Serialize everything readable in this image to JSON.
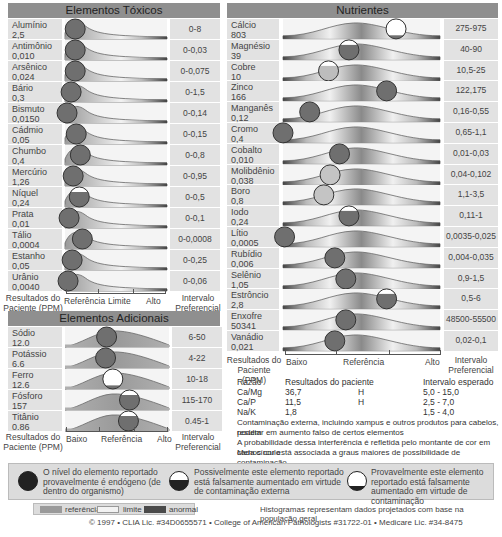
{
  "toxic": {
    "title": "Elementos Tóxicos",
    "rows": [
      {
        "name": "Alumínio",
        "value": "2,5",
        "range": "0-8",
        "pos": 0.1,
        "type": "endogenous"
      },
      {
        "name": "Antimônio",
        "value": "0,010",
        "range": "0-0,03",
        "pos": 0.1,
        "type": "endogenous"
      },
      {
        "name": "Arsênico",
        "value": "0,024",
        "range": "0-0,075",
        "pos": 0.1,
        "type": "endogenous"
      },
      {
        "name": "Bário",
        "value": "0,3",
        "range": "0-1,5",
        "pos": 0.06,
        "type": "endogenous"
      },
      {
        "name": "Bismuto",
        "value": "0,0150",
        "range": "0-0,14",
        "pos": 0.02,
        "type": "endogenous"
      },
      {
        "name": "Cádmio",
        "value": "0,05",
        "range": "0-0,15",
        "pos": 0.11,
        "type": "endogenous"
      },
      {
        "name": "Chumbo",
        "value": "0,4",
        "range": "0-0,8",
        "pos": 0.15,
        "type": "endogenous"
      },
      {
        "name": "Mercúrio",
        "value": "1,26",
        "range": "0-0,95",
        "pos": 0.08,
        "type": "endogenous"
      },
      {
        "name": "Níquel",
        "value": "0,24",
        "range": "0-0,5",
        "pos": 0.14,
        "type": "possible"
      },
      {
        "name": "Prata",
        "value": "0,01",
        "range": "0-0,1",
        "pos": 0.04,
        "type": "endogenous"
      },
      {
        "name": "Tálio",
        "value": "0,0004",
        "range": "0-0,0008",
        "pos": 0.17,
        "type": "endogenous"
      },
      {
        "name": "Estanho",
        "value": "0,05",
        "range": "0-0,25",
        "pos": 0.07,
        "type": "endogenous"
      },
      {
        "name": "Urânio",
        "value": "0,0040",
        "range": "0-0,06",
        "pos": 0.03,
        "type": "endogenous"
      }
    ],
    "footer": {
      "left": "Resultados do Paciente (PPM)",
      "axis": [
        "Referência",
        "Limite",
        "Alto"
      ],
      "right": "Intervalo Preferencial"
    }
  },
  "additional": {
    "title": "Elementos Adicionais",
    "rows": [
      {
        "name": "Sódio",
        "value": "12.0",
        "range": "6-50",
        "pos": 0.4,
        "type": "endogenous"
      },
      {
        "name": "Potássio",
        "value": "6.6",
        "range": "4-22",
        "pos": 0.39,
        "type": "endogenous"
      },
      {
        "name": "Ferro",
        "value": "12.6",
        "range": "10-18",
        "pos": 0.46,
        "type": "probable"
      },
      {
        "name": "Fósforo",
        "value": "157",
        "range": "115-170",
        "pos": 0.62,
        "type": "possible"
      },
      {
        "name": "Titânio",
        "value": "0.86",
        "range": "0.45-1",
        "pos": 0.61,
        "type": "possible"
      }
    ],
    "footer": {
      "left": "Resultados do Paciente (PPM)",
      "axis": [
        "Baixo",
        "Referência",
        "Alto"
      ],
      "right": "Intervalo Preferencial"
    }
  },
  "nutrients": {
    "title": "Nutrientes",
    "rows": [
      {
        "name": "Cálcio",
        "value": "803",
        "range": "275-975",
        "pos": 0.72,
        "type": "probable"
      },
      {
        "name": "Magnésio",
        "value": "39",
        "range": "40-90",
        "pos": 0.42,
        "type": "possible"
      },
      {
        "name": "Cobre",
        "value": "10",
        "range": "10,5-25",
        "pos": 0.29,
        "type": "light-possible"
      },
      {
        "name": "Zinco",
        "value": "166",
        "range": "122,175",
        "pos": 0.66,
        "type": "endogenous"
      },
      {
        "name": "Manganês",
        "value": "0,12",
        "range": "0,16-0,55",
        "pos": 0.17,
        "type": "endogenous"
      },
      {
        "name": "Cromo",
        "value": "0,4",
        "range": "0,65-1,1",
        "pos": 0.0,
        "type": "endogenous"
      },
      {
        "name": "Cobalto",
        "value": "0,010",
        "range": "0,01-0,03",
        "pos": 0.36,
        "type": "endogenous"
      },
      {
        "name": "Molibdênio",
        "value": "0,038",
        "range": "0,04-0,102",
        "pos": 0.3,
        "type": "light"
      },
      {
        "name": "Boro",
        "value": "0,8",
        "range": "1,1-3,5",
        "pos": 0.26,
        "type": "light"
      },
      {
        "name": "Iodo",
        "value": "0,24",
        "range": "0,11-1",
        "pos": 0.42,
        "type": "possible"
      },
      {
        "name": "Lítio",
        "value": "0,0005",
        "range": "0,0035-0,025",
        "pos": 0.01,
        "type": "endogenous"
      },
      {
        "name": "Rubídio",
        "value": "0,006",
        "range": "0,004-0,035",
        "pos": 0.33,
        "type": "endogenous"
      },
      {
        "name": "Selênio",
        "value": "1,05",
        "range": "0,9-1,5",
        "pos": 0.4,
        "type": "endogenous"
      },
      {
        "name": "Estrôncio",
        "value": "2,8",
        "range": "0,5-6",
        "pos": 0.66,
        "type": "possible"
      },
      {
        "name": "Enxofre",
        "value": "50341",
        "range": "48500-55500",
        "pos": 0.4,
        "type": "endogenous"
      },
      {
        "name": "Vanádio",
        "value": "0,021",
        "range": "0,02-0,1",
        "pos": 0.33,
        "type": "endogenous"
      }
    ],
    "footer": {
      "left": "Resultados do Paciente (PPM)",
      "axis": [
        "Baixo",
        "Referência",
        "Alto"
      ],
      "right": "Intervalo Preferencial"
    }
  },
  "ratios": {
    "headers": [
      "Razão",
      "Resultados do paciente",
      "Intervalo esperado"
    ],
    "rows": [
      {
        "ratio": "Ca/Mg",
        "result": "36,7",
        "flag": "H",
        "expected": "5,0 - 15,0"
      },
      {
        "ratio": "Ca/P",
        "result": "11,5",
        "flag": "H",
        "expected": "2,5 - 7,0"
      },
      {
        "ratio": "Na/K",
        "result": "1,8",
        "flag": "",
        "expected": "1,5 - 4,0"
      }
    ],
    "notes": [
      "Contaminação externa, incluindo xampus e outros produtos para cabelos, podem",
      "resultar em aumento falso de certos elementos",
      "A probabilidade dessa interferência é refletida pelo montante de cor em cada círculo",
      "Menos cor está associada a graus maiores de possibilidade de contaminação"
    ]
  },
  "legend": {
    "items": [
      {
        "icon": "solid-circle-icon",
        "text": "O nível do elemento reportado provavelmente é endógeno (de dentro do organismo)"
      },
      {
        "icon": "half-circle-icon",
        "text": "Possivelmente este elemento reportado está falsamente aumentado em virtude de contaminação externa"
      },
      {
        "icon": "empty-circle-icon",
        "text": "Provavelmente este elemento reportado está falsamente aumentado em virtude de contaminação"
      }
    ],
    "swatches": [
      {
        "label": "referência",
        "color": "#9a9a9a"
      },
      {
        "label": "limite",
        "color": "#f2f2f2"
      },
      {
        "label": "anormal",
        "color": "#4a4a4a"
      }
    ],
    "histogram_note": "Histogramas representam dados projetados com base na população geral",
    "copyright": "© 1997 • CLIA Lic. #34D0655571 • College of American Pathologists #31722-01 • Medicare Lic. #34-8475"
  },
  "chart_data": [
    {
      "type": "scatter",
      "title": "Elementos Tóxicos",
      "xlabel": "Referência | Limite | Alto",
      "ylabel": "Resultados do Paciente (PPM)",
      "categories": [
        "Alumínio",
        "Antimônio",
        "Arsênico",
        "Bário",
        "Bismuto",
        "Cádmio",
        "Chumbo",
        "Mercúrio",
        "Níquel",
        "Prata",
        "Tálio",
        "Estanho",
        "Urânio"
      ],
      "values": [
        2.5,
        0.01,
        0.024,
        0.3,
        0.015,
        0.05,
        0.4,
        1.26,
        0.24,
        0.01,
        0.0004,
        0.05,
        0.004
      ],
      "reference_ranges": [
        "0-8",
        "0-0,03",
        "0-0,075",
        "0-1,5",
        "0-0,14",
        "0-0,15",
        "0-0,8",
        "0-0,95",
        "0-0,5",
        "0-0,1",
        "0-0,0008",
        "0-0,25",
        "0-0,06"
      ]
    },
    {
      "type": "scatter",
      "title": "Elementos Adicionais",
      "xlabel": "Baixo | Referência | Alto",
      "categories": [
        "Sódio",
        "Potássio",
        "Ferro",
        "Fósforo",
        "Titânio"
      ],
      "values": [
        12.0,
        6.6,
        12.6,
        157,
        0.86
      ],
      "reference_ranges": [
        "6-50",
        "4-22",
        "10-18",
        "115-170",
        "0.45-1"
      ]
    },
    {
      "type": "scatter",
      "title": "Nutrientes",
      "xlabel": "Baixo | Referência | Alto",
      "categories": [
        "Cálcio",
        "Magnésio",
        "Cobre",
        "Zinco",
        "Manganês",
        "Cromo",
        "Cobalto",
        "Molibdênio",
        "Boro",
        "Iodo",
        "Lítio",
        "Rubídio",
        "Selênio",
        "Estrôncio",
        "Enxofre",
        "Vanádio"
      ],
      "values": [
        803,
        39,
        10,
        166,
        0.12,
        0.4,
        0.01,
        0.038,
        0.8,
        0.24,
        0.0005,
        0.006,
        1.05,
        2.8,
        50341,
        0.021
      ],
      "reference_ranges": [
        "275-975",
        "40-90",
        "10,5-25",
        "122,175",
        "0,16-0,55",
        "0,65-1,1",
        "0,01-0,03",
        "0,04-0,102",
        "1,1-3,5",
        "0,11-1",
        "0,0035-0,025",
        "0,004-0,035",
        "0,9-1,5",
        "0,5-6",
        "48500-55500",
        "0,02-0,1"
      ]
    }
  ]
}
